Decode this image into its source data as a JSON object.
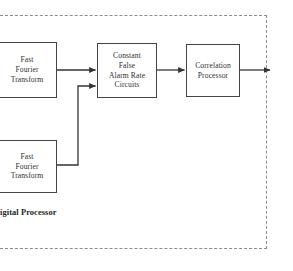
{
  "figure": {
    "background_color": "#ffffff",
    "line_color": "#333333",
    "box_border_color": "#444444",
    "dashed_border_color": "#8c8c8c"
  },
  "region": {
    "name": "digital-processor-region",
    "caption": "igital Processor",
    "style": "dashed"
  },
  "nodes": [
    {
      "id": "fft-top",
      "label": "Fast\nFourier\nTransform"
    },
    {
      "id": "cfar",
      "label": "Constant\nFalse\nAlarm Rate\nCircuits"
    },
    {
      "id": "correlation",
      "label": "Correlation\nProcessor"
    },
    {
      "id": "fft-bottom",
      "label": "Fast\nFourier\nTransform"
    }
  ],
  "connections": [
    {
      "id": "fft-top-to-cfar",
      "from": "fft-top",
      "to": "cfar"
    },
    {
      "id": "fft-bottom-to-cfar",
      "from": "fft-bottom",
      "to": "cfar"
    },
    {
      "id": "cfar-to-correlation",
      "from": "cfar",
      "to": "correlation"
    },
    {
      "id": "correlation-to-output",
      "from": "correlation",
      "to": "output"
    }
  ]
}
